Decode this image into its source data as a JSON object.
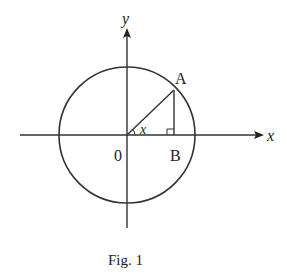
{
  "figure": {
    "caption": "Fig. 1",
    "labels": {
      "y_axis": "y",
      "x_axis": "x",
      "origin": "0",
      "point_a": "A",
      "point_b": "B",
      "angle": "x"
    },
    "colors": {
      "stroke": "#333333",
      "background": "#ffffff"
    },
    "geometry": {
      "shape": "unit circle",
      "description": "Circle centered at origin O with radius OA; A on circle in first quadrant; AB perpendicular to x-axis at B; angle x between OB and OA"
    }
  }
}
